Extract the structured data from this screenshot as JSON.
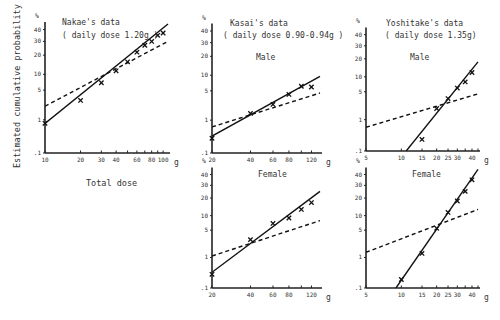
{
  "figure": {
    "ylabel": "Estimated cumulative probability",
    "xlabel": "Total dose",
    "y_unit": "%",
    "x_unit": "g"
  },
  "chart_data": [
    {
      "type": "line",
      "id": "nakae",
      "title": "Nakae's data",
      "subtitle": "( daily dose 1.20g )",
      "panel_label": "",
      "xscale": "log",
      "yscale": "probit",
      "xlabel": "Total dose",
      "ylabel": "Estimated cumulative probability",
      "x_ticks": [
        10,
        20,
        30,
        40,
        50,
        60,
        70,
        80,
        90,
        100
      ],
      "x_tick_labels": [
        "10",
        "20",
        "30",
        "40",
        "",
        "60",
        "",
        "80",
        "",
        "100"
      ],
      "y_ticks": [
        0.1,
        1,
        5,
        10,
        20,
        30,
        40
      ],
      "y_tick_labels": [
        ".1",
        "1",
        "5",
        "10",
        "20",
        "30",
        "40"
      ],
      "xlim": [
        10,
        110
      ],
      "ylim": [
        0.1,
        45
      ],
      "series": [
        {
          "name": "observed",
          "style": "cross",
          "x": [
            10,
            20,
            30,
            40,
            50,
            60,
            70,
            80,
            90,
            100
          ],
          "y": [
            0.8,
            3.0,
            7.0,
            11.5,
            16,
            22,
            27,
            30,
            35,
            37
          ]
        },
        {
          "name": "fitted",
          "style": "solid",
          "x": [
            10,
            110
          ],
          "y": [
            0.8,
            45
          ]
        },
        {
          "name": "expected",
          "style": "dashed",
          "x": [
            10,
            110
          ],
          "y": [
            2.2,
            30
          ]
        }
      ]
    },
    {
      "type": "line",
      "id": "kasai-male",
      "title": "Kasai's data",
      "subtitle": "( daily dose 0.90-0.94g )",
      "panel_label": "Male",
      "xscale": "log",
      "yscale": "probit",
      "x_ticks": [
        20,
        40,
        60,
        80,
        100,
        120
      ],
      "x_tick_labels": [
        "20",
        "40",
        "60",
        "80",
        "",
        "120"
      ],
      "y_ticks": [
        0.1,
        1,
        5,
        10,
        20,
        30,
        40
      ],
      "y_tick_labels": [
        ".1",
        "1",
        "5",
        "10",
        "20",
        "30",
        "40"
      ],
      "xlim": [
        20,
        140
      ],
      "ylim": [
        0.1,
        45
      ],
      "series": [
        {
          "name": "observed",
          "style": "cross",
          "x": [
            20,
            40,
            60,
            80,
            100,
            120
          ],
          "y": [
            0.3,
            1.5,
            2.5,
            4.2,
            6.2,
            6.0
          ]
        },
        {
          "name": "fitted",
          "style": "solid",
          "x": [
            20,
            140
          ],
          "y": [
            0.35,
            9.5
          ]
        },
        {
          "name": "expected",
          "style": "dashed",
          "x": [
            20,
            140
          ],
          "y": [
            0.65,
            4.5
          ]
        }
      ]
    },
    {
      "type": "line",
      "id": "kasai-female",
      "title": "",
      "subtitle": "",
      "panel_label": "Female",
      "xscale": "log",
      "yscale": "probit",
      "x_ticks": [
        20,
        40,
        60,
        80,
        100,
        120
      ],
      "x_tick_labels": [
        "20",
        "40",
        "60",
        "80",
        "",
        "120"
      ],
      "y_ticks": [
        0.1,
        1,
        5,
        10,
        20,
        30,
        40
      ],
      "y_tick_labels": [
        ".1",
        "1",
        "5",
        "10",
        "20",
        "30",
        "40"
      ],
      "xlim": [
        20,
        140
      ],
      "ylim": [
        0.1,
        45
      ],
      "series": [
        {
          "name": "observed",
          "style": "cross",
          "x": [
            20,
            40,
            60,
            80,
            100,
            120
          ],
          "y": [
            0.3,
            3.0,
            7.0,
            9.0,
            13,
            17
          ]
        },
        {
          "name": "fitted",
          "style": "solid",
          "x": [
            20,
            140
          ],
          "y": [
            0.35,
            25
          ]
        },
        {
          "name": "expected",
          "style": "dashed",
          "x": [
            20,
            140
          ],
          "y": [
            1.1,
            8.0
          ]
        }
      ]
    },
    {
      "type": "line",
      "id": "yoshitake-male",
      "title": "Yoshitake's data",
      "subtitle": "( daily dose 1.35g)",
      "panel_label": "Male",
      "xscale": "log",
      "yscale": "probit",
      "x_ticks": [
        5,
        10,
        15,
        20,
        25,
        30,
        35,
        40,
        45
      ],
      "x_tick_labels": [
        "5",
        "10",
        "15",
        "20",
        "25",
        "30",
        "",
        "40",
        ""
      ],
      "y_ticks": [
        0.1,
        1,
        5,
        10,
        20,
        30,
        40
      ],
      "y_tick_labels": [
        ".1",
        "1",
        "5",
        "10",
        "20",
        "30",
        "40"
      ],
      "xlim": [
        5,
        45
      ],
      "ylim": [
        0.1,
        45
      ],
      "series": [
        {
          "name": "observed",
          "style": "cross",
          "x": [
            15,
            20,
            25,
            30,
            35,
            40
          ],
          "y": [
            0.25,
            2.0,
            3.5,
            6.0,
            8.0,
            12
          ]
        },
        {
          "name": "fitted",
          "style": "solid",
          "x": [
            11,
            45
          ],
          "y": [
            0.1,
            18
          ]
        },
        {
          "name": "expected",
          "style": "dashed",
          "x": [
            5,
            45
          ],
          "y": [
            0.6,
            4.5
          ]
        }
      ]
    },
    {
      "type": "line",
      "id": "yoshitake-female",
      "title": "",
      "subtitle": "",
      "panel_label": "Female",
      "xscale": "log",
      "yscale": "probit",
      "x_ticks": [
        5,
        10,
        15,
        20,
        25,
        30,
        35,
        40,
        45
      ],
      "x_tick_labels": [
        "5",
        "10",
        "15",
        "20",
        "25",
        "30",
        "",
        "40",
        ""
      ],
      "y_ticks": [
        0.1,
        1,
        5,
        10,
        20,
        30,
        40
      ],
      "y_tick_labels": [
        ".1",
        "1",
        "5",
        "10",
        "20",
        "30",
        "40"
      ],
      "xlim": [
        5,
        45
      ],
      "ylim": [
        0.1,
        45
      ],
      "series": [
        {
          "name": "observed",
          "style": "cross",
          "x": [
            10,
            15,
            20,
            25,
            30,
            35,
            40
          ],
          "y": [
            0.2,
            1.3,
            5.5,
            11.5,
            18,
            25,
            35
          ]
        },
        {
          "name": "fitted",
          "style": "solid",
          "x": [
            9,
            45
          ],
          "y": [
            0.1,
            45
          ]
        },
        {
          "name": "expected",
          "style": "dashed",
          "x": [
            5,
            45
          ],
          "y": [
            1.4,
            13
          ]
        }
      ]
    }
  ],
  "layout": {
    "panels": [
      {
        "id": "nakae",
        "ax": {
          "x0": 45,
          "x1": 168,
          "y0": 153,
          "ppu": 43.5
        }
      },
      {
        "id": "kasai-male",
        "ax": {
          "x0": 212,
          "x1": 320,
          "y0": 153,
          "ppu": 43
        }
      },
      {
        "id": "kasai-female",
        "ax": {
          "x0": 212,
          "x1": 320,
          "y0": 288,
          "ppu": 40
        }
      },
      {
        "id": "yoshitake-male",
        "ax": {
          "x0": 366,
          "x1": 478,
          "y0": 151,
          "ppu": 41
        }
      },
      {
        "id": "yoshitake-female",
        "ax": {
          "x0": 366,
          "x1": 478,
          "y0": 288,
          "ppu": 40
        }
      }
    ]
  }
}
